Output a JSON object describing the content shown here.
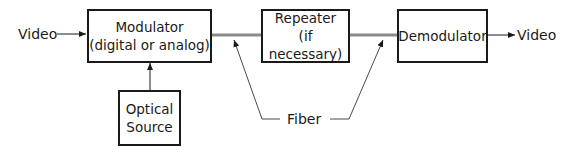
{
  "diagram": {
    "type": "block-diagram",
    "input_label": "Video",
    "output_label": "Video",
    "blocks": [
      {
        "id": "modulator",
        "line1": "Modulator",
        "line2": "(digital or analog)"
      },
      {
        "id": "repeater",
        "line1": "Repeater",
        "line2": "(if necessary)"
      },
      {
        "id": "demodulator",
        "line1": "Demodulator",
        "line2": ""
      },
      {
        "id": "optical-source",
        "line1": "Optical",
        "line2": "Source"
      }
    ],
    "fiber_label": "Fiber",
    "colors": {
      "line": "#1a1a1a",
      "fiber": "#8a8a8a",
      "background": "#ffffff"
    }
  }
}
